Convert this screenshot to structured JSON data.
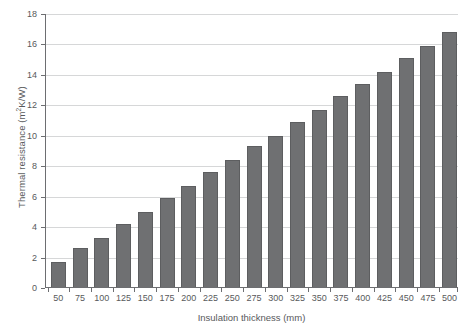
{
  "chart_data": {
    "type": "bar",
    "title": "",
    "xlabel": "Insulation thickness (mm)",
    "ylabel_text": "Thermal resistance (m",
    "ylabel_sup": "2",
    "ylabel_tail": "K/W)",
    "ylabel": "Thermal resistance (m2K/W)",
    "categories": [
      "50",
      "75",
      "100",
      "125",
      "150",
      "175",
      "200",
      "225",
      "250",
      "275",
      "300",
      "325",
      "350",
      "375",
      "400",
      "425",
      "450",
      "475",
      "500"
    ],
    "values": [
      1.7,
      2.6,
      3.3,
      4.2,
      5.0,
      5.9,
      6.7,
      7.6,
      8.4,
      9.3,
      10.0,
      10.9,
      11.7,
      12.6,
      13.4,
      14.2,
      15.1,
      15.9,
      16.8
    ],
    "ylim": [
      0,
      18
    ],
    "ytick_labels": [
      "0",
      "2",
      "4",
      "6",
      "8",
      "10",
      "12",
      "14",
      "16",
      "18"
    ],
    "ytick_values": [
      0,
      2,
      4,
      6,
      8,
      10,
      12,
      14,
      16,
      18
    ],
    "grid": true,
    "legend": "none",
    "bar_color": "#6f7072",
    "grid_color": "#d6d7d8",
    "axis_color": "#6d6e71",
    "text_color": "#58595b"
  }
}
